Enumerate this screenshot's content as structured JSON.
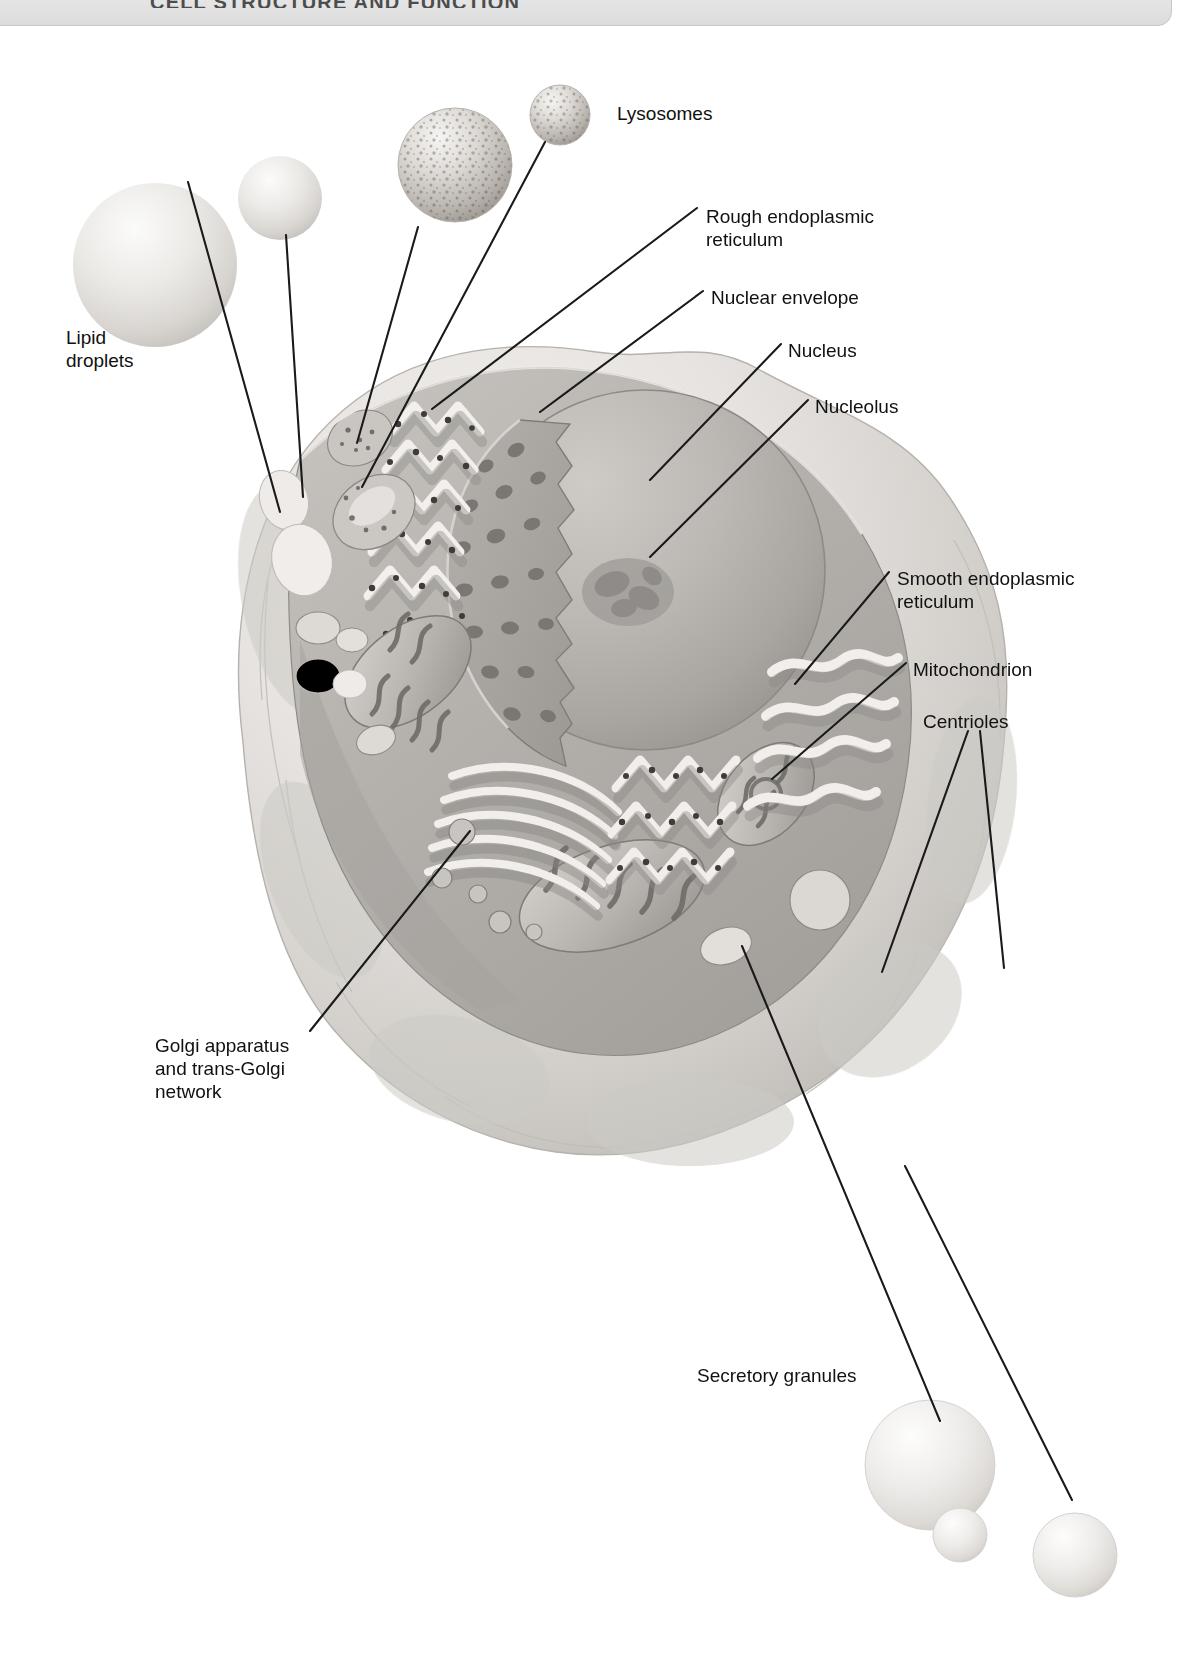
{
  "header": {
    "title": "CELL STRUCTURE AND FUNCTION",
    "bar_color": "#e4e4e4",
    "border_color": "#c6c6c6"
  },
  "figure": {
    "kind": "anatomical-illustration",
    "background": "#ffffff",
    "line_color": "#1a1a1a"
  },
  "labels": [
    {
      "id": "lysosomes",
      "text": "Lysosomes",
      "x": 617,
      "y": 102,
      "align": "left"
    },
    {
      "id": "rough-er",
      "text": "Rough endoplasmic\nreticulum",
      "x": 706,
      "y": 205,
      "align": "left"
    },
    {
      "id": "nuclear-envelope",
      "text": "Nuclear envelope",
      "x": 711,
      "y": 286,
      "align": "left"
    },
    {
      "id": "nucleus",
      "text": "Nucleus",
      "x": 788,
      "y": 339,
      "align": "left"
    },
    {
      "id": "nucleolus",
      "text": "Nucleolus",
      "x": 815,
      "y": 395,
      "align": "left"
    },
    {
      "id": "lipid-droplets",
      "text": "Lipid\ndroplets",
      "x": 66,
      "y": 326,
      "align": "left"
    },
    {
      "id": "smooth-er",
      "text": "Smooth endoplasmic\nreticulum",
      "x": 897,
      "y": 567,
      "align": "left"
    },
    {
      "id": "mitochondrion",
      "text": "Mitochondrion",
      "x": 913,
      "y": 658,
      "align": "left"
    },
    {
      "id": "centrioles",
      "text": "Centrioles",
      "x": 923,
      "y": 710,
      "align": "left"
    },
    {
      "id": "golgi",
      "text": "Golgi apparatus\nand trans-Golgi\nnetwork",
      "x": 155,
      "y": 1034,
      "align": "left"
    },
    {
      "id": "secretory",
      "text": "Secretory granules",
      "x": 697,
      "y": 1364,
      "align": "left"
    }
  ],
  "leader_lines": [
    {
      "id": "leader-lipid-droplet-1",
      "label": "lipid-droplets",
      "points": "188,182 280,512"
    },
    {
      "id": "leader-lipid-droplet-2",
      "label": "lipid-droplets",
      "points": "286,235 303,497"
    },
    {
      "id": "leader-lysosome-1",
      "label": "lysosomes",
      "points": "418,227 357,443"
    },
    {
      "id": "leader-lysosome-2",
      "label": "lysosomes",
      "points": "545,142 362,487"
    },
    {
      "id": "leader-rough-er",
      "label": "rough-er",
      "points": "697,208 432,409"
    },
    {
      "id": "leader-nuclear-env",
      "label": "nuclear-envelope",
      "points": "703,291 540,412"
    },
    {
      "id": "leader-nucleus",
      "label": "nucleus",
      "points": "781,344 650,480"
    },
    {
      "id": "leader-nucleolus",
      "label": "nucleolus",
      "points": "808,400 650,557"
    },
    {
      "id": "leader-smooth-er",
      "label": "smooth-er",
      "points": "889,572 795,684"
    },
    {
      "id": "leader-mitochondrion",
      "label": "mitochondrion",
      "points": "906,663 772,779"
    },
    {
      "id": "leader-centriole-1",
      "label": "centrioles",
      "points": "968,731 882,972"
    },
    {
      "id": "leader-centriole-2",
      "label": "centrioles",
      "points": "980,731 1004,968"
    },
    {
      "id": "leader-golgi",
      "label": "golgi",
      "points": "310,1031 470,831"
    },
    {
      "id": "leader-secretory-1",
      "label": "secretory",
      "points": "940,1421 742,946"
    },
    {
      "id": "leader-secretory-2",
      "label": "secretory",
      "points": "1072,1500 905,1166"
    }
  ],
  "organelles": [
    {
      "id": "lipid-droplet-large",
      "name": "lipid-droplet",
      "cx": 155,
      "cy": 265,
      "r": 82
    },
    {
      "id": "lipid-droplet-small",
      "name": "lipid-droplet",
      "cx": 280,
      "cy": 198,
      "r": 42
    },
    {
      "id": "lysosome-large",
      "name": "lysosome",
      "cx": 455,
      "cy": 165,
      "r": 57
    },
    {
      "id": "lysosome-small",
      "name": "lysosome",
      "cx": 560,
      "cy": 115,
      "r": 30
    },
    {
      "id": "secretory-granule-large",
      "name": "secretory-granule",
      "cx": 930,
      "cy": 1465,
      "r": 65
    },
    {
      "id": "secretory-granule-tiny",
      "name": "secretory-granule",
      "cx": 960,
      "cy": 1535,
      "r": 27
    },
    {
      "id": "secretory-granule-medium",
      "name": "secretory-granule",
      "cx": 1075,
      "cy": 1555,
      "r": 42
    }
  ],
  "palette": {
    "cell_body_light": "#e6e4e2",
    "cell_body_mid": "#cfccc9",
    "cytoplasm": "#b9b6b2",
    "cytoplasm_dark": "#9d9a96",
    "nucleus": "#b0adaa",
    "nucleolus": "#9a9794",
    "membrane_highlight": "#f4f2f0",
    "ribosome": "#4a4a4a",
    "outline": "#1a1a1a"
  }
}
